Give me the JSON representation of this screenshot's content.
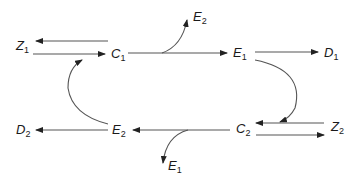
{
  "nodes": {
    "Z1": {
      "letter": "Z",
      "sub": "1"
    },
    "C1": {
      "letter": "C",
      "sub": "1"
    },
    "E1_top": {
      "letter": "E",
      "sub": "1"
    },
    "D1": {
      "letter": "D",
      "sub": "1"
    },
    "E2_top": {
      "letter": "E",
      "sub": "2"
    },
    "D2": {
      "letter": "D",
      "sub": "2"
    },
    "E2_bottom": {
      "letter": "E",
      "sub": "2"
    },
    "C2": {
      "letter": "C",
      "sub": "2"
    },
    "Z2": {
      "letter": "Z",
      "sub": "2"
    },
    "E1_bottom": {
      "letter": "E",
      "sub": "1"
    }
  },
  "edges": [
    {
      "from": "C1",
      "to": "Z1",
      "kind": "straight"
    },
    {
      "from": "Z1",
      "to": "C1",
      "kind": "straight"
    },
    {
      "from": "C1",
      "to": "E1",
      "kind": "straight"
    },
    {
      "from": "C1-E1 line",
      "to": "E2",
      "kind": "curved branch"
    },
    {
      "from": "E1",
      "to": "D1",
      "kind": "straight"
    },
    {
      "from": "E1",
      "to": "C2",
      "kind": "curved"
    },
    {
      "from": "Z2",
      "to": "C2",
      "kind": "straight"
    },
    {
      "from": "C2",
      "to": "Z2",
      "kind": "straight"
    },
    {
      "from": "C2",
      "to": "E2",
      "kind": "straight"
    },
    {
      "from": "C2-E2 line",
      "to": "E1",
      "kind": "curved branch"
    },
    {
      "from": "E2",
      "to": "D2",
      "kind": "straight"
    },
    {
      "from": "E2",
      "to": "C1",
      "kind": "curved"
    }
  ],
  "colors": {
    "line": "#555555",
    "text": "#1a1a1a"
  }
}
